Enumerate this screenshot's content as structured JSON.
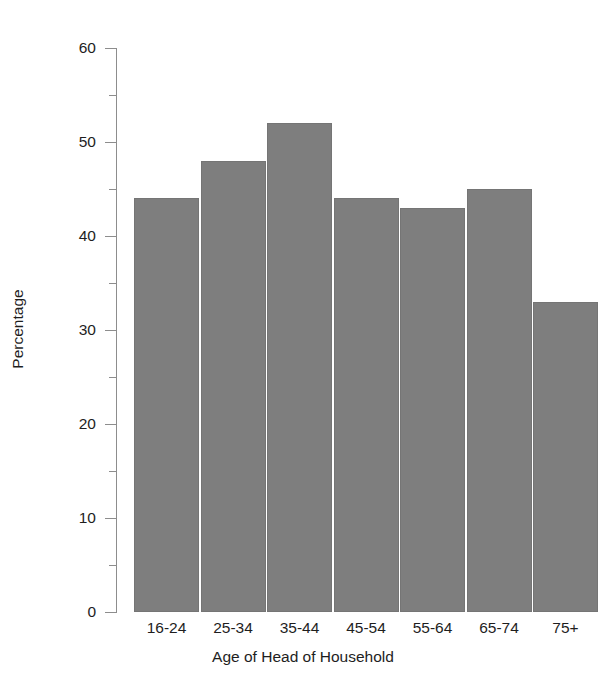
{
  "chart_data": {
    "type": "bar",
    "title": "",
    "subtitle": "",
    "xlabel": "Age of Head of Household",
    "ylabel": "Percentage",
    "categories": [
      "16-24",
      "25-34",
      "35-44",
      "45-54",
      "55-64",
      "65-74",
      "75+"
    ],
    "values": [
      44,
      48,
      52,
      44,
      43,
      45,
      33
    ],
    "series": [
      {
        "name": "Percentage",
        "values": [
          44,
          48,
          52,
          44,
          43,
          45,
          33
        ]
      }
    ],
    "ylim": [
      0,
      60
    ],
    "y_major_ticks": [
      0,
      10,
      20,
      30,
      40,
      50,
      60
    ],
    "y_minor_ticks": [
      5,
      15,
      25,
      35,
      45,
      55
    ],
    "y_tick_labels": [
      "0",
      "10",
      "20",
      "30",
      "40",
      "50",
      "60"
    ],
    "grid": false,
    "legend": false,
    "legend_position": "none",
    "bar_color": "#7e7e7e",
    "bar_edge_color": "#757575",
    "axis_color": "#8d8d8d",
    "background_color": "#ffffff",
    "text_color": "#1e1e1e"
  }
}
